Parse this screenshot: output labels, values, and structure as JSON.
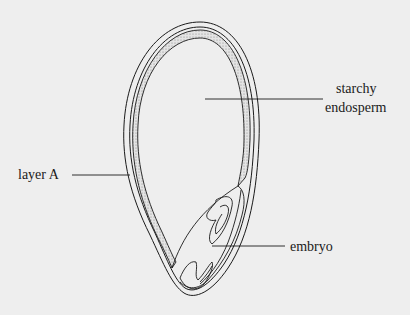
{
  "diagram": {
    "labels": {
      "starchy_endosperm_line1": "starchy",
      "starchy_endosperm_line2": "endosperm",
      "layer_a": "layer A",
      "embryo": "embryo"
    },
    "colors": {
      "background": "#eeeeee",
      "stroke": "#1a1a1a",
      "stipple": "#b8b8b8"
    }
  }
}
